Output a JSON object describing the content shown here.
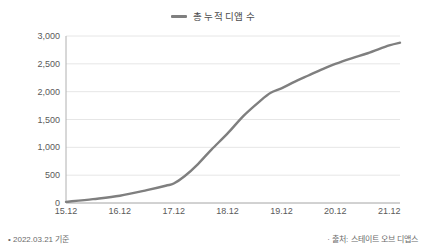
{
  "legend": {
    "label": "총 누적 디앱 수",
    "swatch_color": "#7f7f7f"
  },
  "footer": {
    "left_note": "• 2022.03.21 기준",
    "right_note": "· 출처: 스테이트 오브 디앱스"
  },
  "chart_data": {
    "type": "line",
    "title": "",
    "subtitle": "",
    "xlabel": "",
    "ylabel": "",
    "categories": [
      "15.12",
      "16.12",
      "17.12",
      "18.12",
      "19.12",
      "20.12",
      "21.12"
    ],
    "x_tick_labels": [
      "15.12",
      "16.12",
      "17.12",
      "18.12",
      "19.12",
      "20.12",
      "21.12"
    ],
    "y_tick_labels": [
      "0",
      "500",
      "1,000",
      "1,500",
      "2,000",
      "2,500",
      "3,000"
    ],
    "y_tick_values": [
      0,
      500,
      1000,
      1500,
      2000,
      2500,
      3000
    ],
    "ylim": [
      0,
      3000
    ],
    "grid": true,
    "grid_color": "#e6e6e6",
    "legend_position": "top-center",
    "line_color": "#7f7f7f",
    "line_width": 2.4,
    "series": [
      {
        "name": "총 누적 디앱 수",
        "x": [
          "15.12",
          "16.12",
          "17.12",
          "18.12",
          "19.12",
          "20.12",
          "21.12"
        ],
        "values": [
          20,
          130,
          350,
          1250,
          2060,
          2500,
          2830
        ],
        "dense_points": [
          {
            "x": 0.0,
            "y": 20
          },
          {
            "x": 0.5,
            "y": 70
          },
          {
            "x": 1.0,
            "y": 130
          },
          {
            "x": 1.5,
            "y": 230
          },
          {
            "x": 1.85,
            "y": 310
          },
          {
            "x": 2.0,
            "y": 350
          },
          {
            "x": 2.2,
            "y": 480
          },
          {
            "x": 2.45,
            "y": 700
          },
          {
            "x": 2.7,
            "y": 960
          },
          {
            "x": 3.0,
            "y": 1250
          },
          {
            "x": 3.3,
            "y": 1570
          },
          {
            "x": 3.6,
            "y": 1830
          },
          {
            "x": 3.8,
            "y": 1980
          },
          {
            "x": 4.0,
            "y": 2060
          },
          {
            "x": 4.25,
            "y": 2180
          },
          {
            "x": 4.5,
            "y": 2290
          },
          {
            "x": 4.75,
            "y": 2400
          },
          {
            "x": 5.0,
            "y": 2500
          },
          {
            "x": 5.3,
            "y": 2600
          },
          {
            "x": 5.6,
            "y": 2690
          },
          {
            "x": 6.0,
            "y": 2830
          },
          {
            "x": 6.2,
            "y": 2880
          }
        ]
      }
    ],
    "end_value": 2880,
    "x_axis_end": 6.2
  }
}
